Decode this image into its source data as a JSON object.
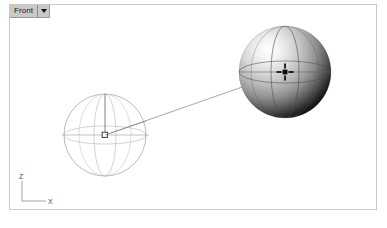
{
  "viewport": {
    "title": "Front",
    "dropdown_icon": "chevron-down-icon",
    "background_color": "#ffffff",
    "border_color": "#c9c9c9",
    "tab_background_color": "#c8c8c8"
  },
  "axis_gizmo": {
    "z_label": "Z",
    "x_label": "X",
    "color": "#808080"
  },
  "objects": {
    "wireframe_sphere": {
      "name": "wireframe-sphere",
      "center_x": 95,
      "center_y": 130,
      "radius": 41,
      "stroke_color": "#9a9a9a",
      "control_point_color": "#3c3c3c"
    },
    "shaded_sphere": {
      "name": "shaded-sphere",
      "center_x": 275,
      "center_y": 67,
      "radius": 46,
      "highlight_color": "#ffffff",
      "midtone_color": "#b0b0b0",
      "shadow_color": "#1a1a1a",
      "isocurve_color": "#555555",
      "center_marker_color": "#111111"
    },
    "connector_line": {
      "name": "connector-line",
      "x1": 95,
      "y1": 130,
      "x2": 275,
      "y2": 67,
      "stroke_color": "#7a7a7a"
    },
    "radius_line": {
      "name": "radius-line",
      "x1": 95,
      "y1": 130,
      "x2": 95,
      "y2": 89,
      "stroke_color": "#5a5a5a"
    }
  }
}
